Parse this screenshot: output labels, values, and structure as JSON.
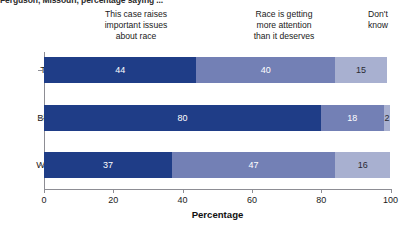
{
  "caption": "Ferguson, Missouri, percentage saying ...",
  "chart_data": {
    "type": "bar",
    "orientation": "horizontal",
    "stacked": true,
    "title": "Ferguson, Missouri, percentage saying ...",
    "xlabel": "Percentage",
    "ylabel": "",
    "xlim": [
      0,
      100
    ],
    "xticks": [
      0,
      20,
      40,
      60,
      80,
      100
    ],
    "xtick_labels": [
      "0",
      "20",
      "40",
      "60",
      "80",
      "100"
    ],
    "grid": false,
    "legend_position": "top-as-column-headers",
    "categories": [
      "Total",
      "Black",
      "White"
    ],
    "series": [
      {
        "name": "This case raises important issues about race",
        "color": "#1f3d87",
        "values": [
          44,
          80,
          37
        ],
        "labels": [
          "44",
          "80",
          "37"
        ]
      },
      {
        "name": "Race is getting more attention than it deserves",
        "color": "#7380b5",
        "values": [
          40,
          18,
          47
        ],
        "labels": [
          "40",
          "18",
          "47"
        ]
      },
      {
        "name": "Don't know",
        "color": "#a8b0d0",
        "values": [
          15,
          2,
          16
        ],
        "labels": [
          "15",
          "2",
          "16"
        ]
      }
    ]
  },
  "column_headers": [
    "This case raises\nimportant issues\nabout race",
    "Race is getting\nmore attention\nthan it deserves",
    "Don't\nknow"
  ],
  "colors": {
    "series_dark": "#1f3d87",
    "series_medium": "#7380b5",
    "series_light": "#a8b0d0",
    "axis": "#8d8d94",
    "text": "#1a1a1a",
    "background": "#ffffff"
  }
}
